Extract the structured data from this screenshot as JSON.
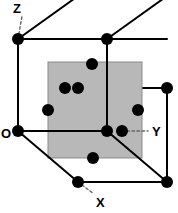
{
  "figure": {
    "name": "face-centered-cubic-unit-cell",
    "width": 178,
    "height": 213,
    "background_color": "#ffffff"
  },
  "colors": {
    "line": "#000000",
    "atom_fill": "#000000",
    "plane_fill": "#b8b8b8",
    "plane_stroke": "#8a8a8a",
    "axis_dash": "#666666",
    "label_text": "#000000"
  },
  "axes": {
    "labels": [
      {
        "id": "z",
        "text": "Z",
        "x": 13,
        "y": 2,
        "origin_x": 18,
        "origin_y": 39,
        "tip_x": 22,
        "tip_y": 16
      },
      {
        "id": "o",
        "text": "O",
        "x": 1,
        "y": 127,
        "origin_x": 18,
        "origin_y": 131,
        "tip_x": 18,
        "tip_y": 131
      },
      {
        "id": "y",
        "text": "Y",
        "x": 152,
        "y": 125,
        "origin_x": 122,
        "origin_y": 131,
        "tip_x": 148,
        "tip_y": 131
      },
      {
        "id": "x",
        "text": "X",
        "x": 96,
        "y": 196,
        "origin_x": 78,
        "origin_y": 182,
        "tip_x": 94,
        "tip_y": 194
      }
    ]
  },
  "cube": {
    "description": "Cubic unit cell drawn in oblique projection",
    "vertices": [
      {
        "id": "front-top-left",
        "x": 18,
        "y": 39
      },
      {
        "id": "front-top-right",
        "x": 107,
        "y": 39
      },
      {
        "id": "front-bottom-left",
        "x": 18,
        "y": 131
      },
      {
        "id": "front-bottom-right",
        "x": 107,
        "y": 131
      },
      {
        "id": "back-top-left",
        "x": 78,
        "y": -4
      },
      {
        "id": "back-top-right",
        "x": 167,
        "y": -4
      },
      {
        "id": "back-bottom-left",
        "x": 78,
        "y": 182
      },
      {
        "id": "back-bottom-right",
        "x": 167,
        "y": 182
      },
      {
        "id": "right-top-back",
        "x": 167,
        "y": 88
      }
    ],
    "edges": [
      {
        "id": "front-top",
        "x1": 18,
        "y1": 39,
        "x2": 107,
        "y2": 39
      },
      {
        "id": "front-left",
        "x1": 18,
        "y1": 39,
        "x2": 18,
        "y2": 131
      },
      {
        "id": "front-bottom",
        "x1": 18,
        "y1": 131,
        "x2": 107,
        "y2": 131
      },
      {
        "id": "front-right",
        "x1": 107,
        "y1": 39,
        "x2": 107,
        "y2": 131
      },
      {
        "id": "diag-top-left",
        "x1": 18,
        "y1": 39,
        "x2": 78,
        "y2": -4
      },
      {
        "id": "diag-top-right",
        "x1": 107,
        "y1": 39,
        "x2": 167,
        "y2": -4
      },
      {
        "id": "diag-bottom-left",
        "x1": 18,
        "y1": 131,
        "x2": 78,
        "y2": 182
      },
      {
        "id": "diag-bottom-right",
        "x1": 107,
        "y1": 131,
        "x2": 167,
        "y2": 182
      },
      {
        "id": "back-bottom",
        "x1": 78,
        "y1": 182,
        "x2": 167,
        "y2": 182
      },
      {
        "id": "back-right-vert",
        "x1": 167,
        "y1": 88,
        "x2": 167,
        "y2": 182
      },
      {
        "id": "mid-horizontal",
        "x1": 107,
        "y1": 88,
        "x2": 167,
        "y2": 88
      },
      {
        "id": "top-back-horiz",
        "x1": 107,
        "y1": 39,
        "x2": 167,
        "y2": 39
      }
    ]
  },
  "plane": {
    "id": "shaded-lattice-plane",
    "label": "Shaded crystallographic plane",
    "x": 48,
    "y": 62,
    "width": 94,
    "height": 96
  },
  "atoms": [
    {
      "id": "atom-corner-front-top-left",
      "type": "corner",
      "x": 18,
      "y": 39,
      "r": 6
    },
    {
      "id": "atom-corner-front-top-right",
      "type": "corner",
      "x": 107,
      "y": 39,
      "r": 6
    },
    {
      "id": "atom-corner-origin",
      "type": "corner",
      "x": 18,
      "y": 131,
      "r": 6
    },
    {
      "id": "atom-corner-front-bottom-right",
      "type": "corner",
      "x": 107,
      "y": 131,
      "r": 6
    },
    {
      "id": "atom-corner-back-bottom-left",
      "type": "corner",
      "x": 78,
      "y": 182,
      "r": 6
    },
    {
      "id": "atom-corner-back-bottom-right",
      "type": "corner",
      "x": 167,
      "y": 182,
      "r": 6
    },
    {
      "id": "atom-corner-back-right-top",
      "type": "corner",
      "x": 167,
      "y": 88,
      "r": 6
    },
    {
      "id": "atom-face-top",
      "type": "face-center",
      "x": 92,
      "y": 64,
      "r": 6
    },
    {
      "id": "atom-face-upper-left",
      "type": "face-center",
      "x": 65,
      "y": 88,
      "r": 6
    },
    {
      "id": "atom-face-center-upper",
      "type": "face-center",
      "x": 78,
      "y": 88,
      "r": 6
    },
    {
      "id": "atom-face-left",
      "type": "face-center",
      "x": 48,
      "y": 110,
      "r": 6
    },
    {
      "id": "atom-face-right",
      "type": "face-center",
      "x": 138,
      "y": 110,
      "r": 6
    },
    {
      "id": "atom-face-y-side",
      "type": "face-center",
      "x": 122,
      "y": 131,
      "r": 6
    },
    {
      "id": "atom-face-bottom",
      "type": "face-center",
      "x": 93,
      "y": 158,
      "r": 6
    }
  ]
}
